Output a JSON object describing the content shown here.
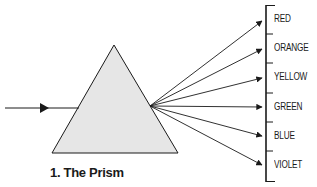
{
  "caption": "1. The Prism",
  "colors": {
    "ink": "#1a1a1a",
    "prism_fill": "#e6e6e6",
    "background": "#ffffff"
  },
  "diagram": {
    "incoming_ray": {
      "label": "white light",
      "direction": "left-to-right"
    },
    "prism": {
      "shape": "triangle"
    },
    "spectrum": [
      {
        "label": "RED"
      },
      {
        "label": "ORANGE"
      },
      {
        "label": "YELLOW"
      },
      {
        "label": "GREEN"
      },
      {
        "label": "BLUE"
      },
      {
        "label": "VIOLET"
      }
    ]
  }
}
